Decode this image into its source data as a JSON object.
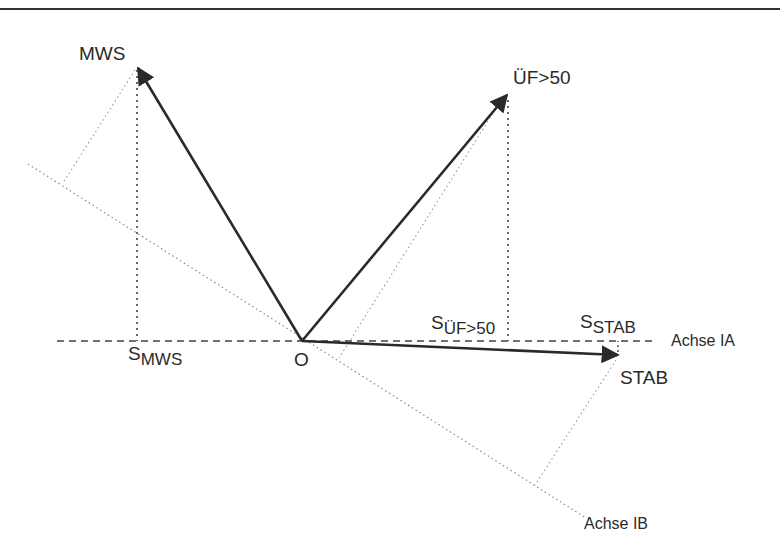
{
  "diagram": {
    "type": "vector-projection",
    "colors": {
      "ink": "#2a2a2a",
      "dotted": "#8a8a8a",
      "border": "#333333",
      "background": "#ffffff"
    },
    "origin": {
      "label": "O"
    },
    "vectors": [
      {
        "id": "mws",
        "label": "MWS"
      },
      {
        "id": "uef50",
        "label": "ÜF>50"
      },
      {
        "id": "stab",
        "label": "STAB"
      }
    ],
    "axes": [
      {
        "id": "ia",
        "label": "Achse IA",
        "style": "dashed"
      },
      {
        "id": "ib",
        "label": "Achse IB",
        "style": "dotted"
      }
    ],
    "projections": [
      {
        "base": "S",
        "subscript": "MWS"
      },
      {
        "base": "S",
        "subscript": "ÜF>50"
      },
      {
        "base": "S",
        "subscript": "STAB"
      }
    ]
  }
}
